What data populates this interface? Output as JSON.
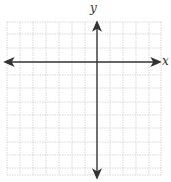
{
  "diagram": {
    "type": "coordinate-plane-grid",
    "x_axis_label": "x",
    "y_axis_label": "y",
    "colors": {
      "grid": "#cfcfcf",
      "axis": "#333333",
      "background": "#ffffff"
    },
    "grid": {
      "x_lines": [
        7,
        20,
        33,
        46,
        59,
        72,
        85,
        110,
        123,
        136,
        149,
        161
      ],
      "y_lines": [
        22,
        34,
        48,
        75,
        88,
        102,
        115,
        128,
        142,
        155,
        168,
        175
      ],
      "x_range": [
        7,
        161
      ],
      "y_range": [
        22,
        175
      ]
    },
    "axes": {
      "x_axis_y": 62,
      "y_axis_x": 97,
      "x_extent": [
        5,
        160
      ],
      "y_extent": [
        22,
        178
      ]
    }
  }
}
